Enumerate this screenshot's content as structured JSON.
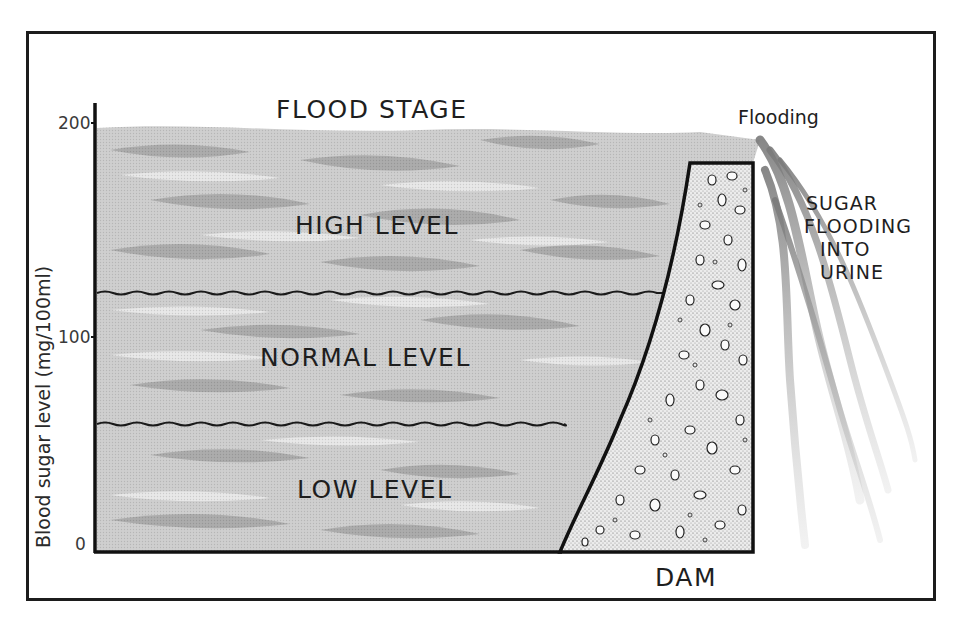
{
  "diagram": {
    "title_label": "FLOOD STAGE",
    "y_axis": {
      "label": "Blood sugar level (mg/100ml)",
      "ticks": [
        "200",
        "100",
        "0"
      ]
    },
    "zones": [
      {
        "id": "high",
        "label": "HIGH LEVEL"
      },
      {
        "id": "normal",
        "label": "NORMAL LEVEL"
      },
      {
        "id": "low",
        "label": "LOW LEVEL"
      }
    ],
    "dam_label": "DAM",
    "overflow_label": "Flooding",
    "overflow_description": [
      "SUGAR",
      "FLOODING",
      "INTO",
      "URINE"
    ],
    "colors": {
      "frame": "#1c1c1c",
      "water_light": "#d4d4d4",
      "water_dark": "#8a8a8a",
      "dam_fill": "#e6e6e6"
    }
  }
}
